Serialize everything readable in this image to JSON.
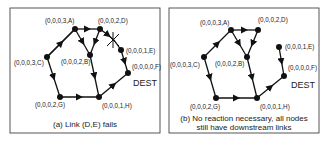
{
  "panels": [
    {
      "id": "a",
      "caption": "(a) Link (D,E) fails",
      "dest_label": "DEST",
      "nodes": {
        "A": {
          "label": "(0,0,0,3,A)",
          "x": 75,
          "y": 29
        },
        "D": {
          "label": "(0,0,0,2,D)",
          "x": 100,
          "y": 29
        },
        "B": {
          "label": "(0,0,0,2,B)",
          "x": 90,
          "y": 55
        },
        "C": {
          "label": "(0,0,0,3,C)",
          "x": 47,
          "y": 57
        },
        "E": {
          "label": "(0,0,0,1,E)",
          "x": 121,
          "y": 50
        },
        "F": {
          "label": "(0,0,0,0,F)",
          "x": 128,
          "y": 73
        },
        "G": {
          "label": "(0,0,0,2,G)",
          "x": 60,
          "y": 97
        },
        "H": {
          "label": "(0,0,0,1,H)",
          "x": 99,
          "y": 97
        }
      },
      "edges": [
        [
          "C",
          "A"
        ],
        [
          "A",
          "D"
        ],
        [
          "A",
          "B"
        ],
        [
          "D",
          "B"
        ],
        [
          "D",
          "E"
        ],
        [
          "E",
          "F"
        ],
        [
          "C",
          "G"
        ],
        [
          "B",
          "H"
        ],
        [
          "G",
          "H"
        ],
        [
          "H",
          "F"
        ]
      ],
      "failed_link": [
        "D",
        "E"
      ]
    },
    {
      "id": "b",
      "caption_line1": "(b) No reaction necessary, all nodes",
      "caption_line2": "still have downstream links",
      "dest_label": "DEST",
      "nodes": {
        "A": {
          "label": "(0,0,0,3,A)",
          "x": 231,
          "y": 30
        },
        "D": {
          "label": "(0,0,0,2,D)",
          "x": 258,
          "y": 30
        },
        "B": {
          "label": "(0,0,0,2,B)",
          "x": 247,
          "y": 57
        },
        "C": {
          "label": "(0,0,0,3,C)",
          "x": 204,
          "y": 57
        },
        "E": {
          "label": "(0,0,0,1,E)",
          "x": 279,
          "y": 47
        },
        "F": {
          "label": "(0,0,0,0,F)",
          "x": 284,
          "y": 76
        },
        "G": {
          "label": "(0,0,0,2,G)",
          "x": 216,
          "y": 98
        },
        "H": {
          "label": "(0,0,0,1,H)",
          "x": 257,
          "y": 98
        }
      },
      "edges": [
        [
          "C",
          "A"
        ],
        [
          "A",
          "D"
        ],
        [
          "A",
          "B"
        ],
        [
          "D",
          "B"
        ],
        [
          "E",
          "F"
        ],
        [
          "C",
          "G"
        ],
        [
          "B",
          "H"
        ],
        [
          "G",
          "H"
        ],
        [
          "H",
          "F"
        ]
      ]
    }
  ]
}
